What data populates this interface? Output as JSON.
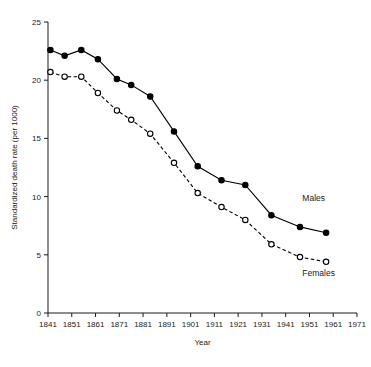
{
  "chart_data": {
    "type": "line",
    "title": "",
    "subtitle": "",
    "xlabel": "Year",
    "ylabel": "Standardized death rate (per 1000)",
    "xlim": [
      1841,
      1971
    ],
    "ylim": [
      0,
      25
    ],
    "yticks": [
      0,
      5,
      10,
      15,
      20,
      25
    ],
    "ytick_labels": [
      "0",
      "5",
      "10",
      "15",
      "20",
      "25"
    ],
    "xticks": [
      1841,
      1851,
      1861,
      1871,
      1881,
      1891,
      1901,
      1911,
      1921,
      1931,
      1941,
      1951,
      1961,
      1971
    ],
    "xtick_labels": [
      "1841",
      "1851",
      "1861",
      "1871",
      "1881",
      "1891",
      "1901",
      "1911",
      "1921",
      "1931",
      "1941",
      "1951",
      "1961",
      "1971"
    ],
    "grid": false,
    "legend_position": "inline-annotation",
    "x": [
      1842,
      1848,
      1855,
      1862,
      1870,
      1876,
      1884,
      1894,
      1904,
      1914,
      1924,
      1935,
      1947,
      1958
    ],
    "series": [
      {
        "name": "Males",
        "marker": "filled-circle",
        "line_style": "solid",
        "color": "#000000",
        "values": [
          22.6,
          22.1,
          22.6,
          21.8,
          20.1,
          19.6,
          18.6,
          15.6,
          12.6,
          11.4,
          11.0,
          8.4,
          7.4,
          6.9
        ]
      },
      {
        "name": "Females",
        "marker": "open-circle",
        "line_style": "dashed",
        "color": "#000000",
        "values": [
          20.7,
          20.3,
          20.3,
          18.9,
          17.4,
          16.6,
          15.4,
          12.9,
          10.3,
          9.1,
          8.0,
          5.9,
          4.8,
          4.4
        ]
      }
    ],
    "annotations": [
      {
        "text": "Males",
        "x": 1948,
        "y": 9.6
      },
      {
        "text": "Females",
        "x": 1948,
        "y": 3.2
      }
    ]
  },
  "axis": {
    "x_title": "Year",
    "y_title": "Standardized death rate (per 1000)"
  }
}
